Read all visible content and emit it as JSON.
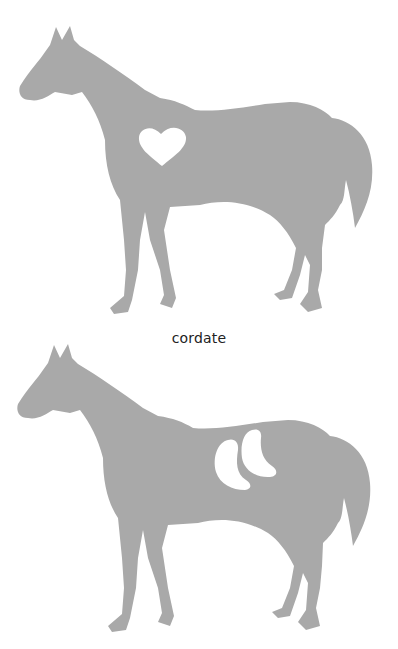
{
  "figure": {
    "silhouette_color": "#a9a9a9",
    "background_color": "#ffffff",
    "panels": [
      {
        "id": "top",
        "subject": "horse silhouette",
        "marking_shape": "heart",
        "caption": "cordate"
      },
      {
        "id": "bottom",
        "subject": "horse silhouette",
        "marking_shape": "two crescents",
        "caption": ""
      }
    ]
  }
}
